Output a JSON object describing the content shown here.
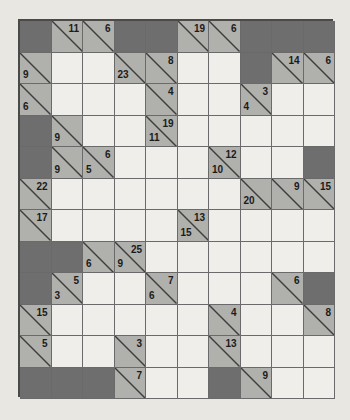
{
  "puzzle": {
    "name": "kakuro-grid",
    "rows": 12,
    "cols": 10,
    "cell_size": 31.5,
    "colors": {
      "block": "#6e6e6e",
      "clue": "#b0b0ac",
      "open": "#f0eeea",
      "grid_line": "#6a6a6a",
      "border": "#4a4a4a",
      "paper": "#e9e7e2",
      "clue_text": "#1b1b1b"
    },
    "legend": {
      "block_label": "block",
      "clue_label": "clue",
      "open_label": "open"
    },
    "cells": [
      [
        {
          "t": "block"
        },
        {
          "t": "clue",
          "down": "11"
        },
        {
          "t": "clue",
          "down": "6"
        },
        {
          "t": "block"
        },
        {
          "t": "block"
        },
        {
          "t": "clue",
          "down": "19"
        },
        {
          "t": "clue",
          "down": "6"
        },
        {
          "t": "block"
        },
        {
          "t": "block"
        },
        {
          "t": "block"
        }
      ],
      [
        {
          "t": "clue",
          "right": "9"
        },
        {
          "t": "open"
        },
        {
          "t": "open"
        },
        {
          "t": "clue",
          "right": "23"
        },
        {
          "t": "clue",
          "down": "8"
        },
        {
          "t": "open"
        },
        {
          "t": "open"
        },
        {
          "t": "block"
        },
        {
          "t": "clue",
          "down": "14"
        },
        {
          "t": "clue",
          "down": "6"
        }
      ],
      [
        {
          "t": "clue",
          "right": "6"
        },
        {
          "t": "open"
        },
        {
          "t": "open"
        },
        {
          "t": "open"
        },
        {
          "t": "clue",
          "down": "4"
        },
        {
          "t": "open"
        },
        {
          "t": "open"
        },
        {
          "t": "clue",
          "down": "3",
          "right": "4"
        },
        {
          "t": "open"
        },
        {
          "t": "open"
        }
      ],
      [
        {
          "t": "block"
        },
        {
          "t": "clue",
          "right": "9"
        },
        {
          "t": "open"
        },
        {
          "t": "open"
        },
        {
          "t": "clue",
          "down": "19",
          "right": "11"
        },
        {
          "t": "open"
        },
        {
          "t": "open"
        },
        {
          "t": "open"
        },
        {
          "t": "open"
        },
        {
          "t": "open"
        }
      ],
      [
        {
          "t": "block"
        },
        {
          "t": "clue",
          "right": "9"
        },
        {
          "t": "clue",
          "down": "6",
          "right": "5"
        },
        {
          "t": "open"
        },
        {
          "t": "open"
        },
        {
          "t": "open"
        },
        {
          "t": "clue",
          "down": "12",
          "right": "10"
        },
        {
          "t": "open"
        },
        {
          "t": "open"
        },
        {
          "t": "block"
        }
      ],
      [
        {
          "t": "clue",
          "down": "22"
        },
        {
          "t": "open"
        },
        {
          "t": "open"
        },
        {
          "t": "open"
        },
        {
          "t": "open"
        },
        {
          "t": "open"
        },
        {
          "t": "open"
        },
        {
          "t": "clue",
          "right": "20"
        },
        {
          "t": "clue",
          "down": "9"
        },
        {
          "t": "clue",
          "down": "15"
        }
      ],
      [
        {
          "t": "clue",
          "down": "17"
        },
        {
          "t": "open"
        },
        {
          "t": "open"
        },
        {
          "t": "open"
        },
        {
          "t": "open"
        },
        {
          "t": "clue",
          "down": "13",
          "right": "15"
        },
        {
          "t": "open"
        },
        {
          "t": "open"
        },
        {
          "t": "open"
        },
        {
          "t": "open"
        }
      ],
      [
        {
          "t": "block"
        },
        {
          "t": "block"
        },
        {
          "t": "clue",
          "right": "6"
        },
        {
          "t": "clue",
          "down": "25",
          "right": "9"
        },
        {
          "t": "open"
        },
        {
          "t": "open"
        },
        {
          "t": "open"
        },
        {
          "t": "open"
        },
        {
          "t": "open"
        },
        {
          "t": "open"
        }
      ],
      [
        {
          "t": "block"
        },
        {
          "t": "clue",
          "down": "5",
          "right": "3"
        },
        {
          "t": "open"
        },
        {
          "t": "open"
        },
        {
          "t": "clue",
          "down": "7",
          "right": "6"
        },
        {
          "t": "open"
        },
        {
          "t": "open"
        },
        {
          "t": "open"
        },
        {
          "t": "clue",
          "down": "6"
        },
        {
          "t": "block"
        }
      ],
      [
        {
          "t": "clue",
          "down": "15"
        },
        {
          "t": "open"
        },
        {
          "t": "open"
        },
        {
          "t": "open"
        },
        {
          "t": "open"
        },
        {
          "t": "open"
        },
        {
          "t": "clue",
          "down": "4"
        },
        {
          "t": "open"
        },
        {
          "t": "open"
        },
        {
          "t": "clue",
          "down": "8"
        }
      ],
      [
        {
          "t": "clue",
          "down": "5"
        },
        {
          "t": "open"
        },
        {
          "t": "open"
        },
        {
          "t": "clue",
          "down": "3"
        },
        {
          "t": "open"
        },
        {
          "t": "open"
        },
        {
          "t": "clue",
          "down": "13"
        },
        {
          "t": "open"
        },
        {
          "t": "open"
        },
        {
          "t": "open"
        }
      ],
      [
        {
          "t": "block"
        },
        {
          "t": "block"
        },
        {
          "t": "block"
        },
        {
          "t": "clue",
          "down": "7"
        },
        {
          "t": "open"
        },
        {
          "t": "open"
        },
        {
          "t": "block"
        },
        {
          "t": "clue",
          "down": "9"
        },
        {
          "t": "open"
        },
        {
          "t": "open"
        }
      ]
    ]
  }
}
